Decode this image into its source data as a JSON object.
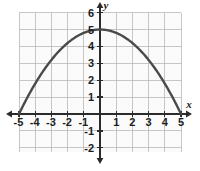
{
  "chart_data": {
    "type": "line",
    "title": "",
    "subtitle": "",
    "xlabel": "x",
    "ylabel": "y",
    "xlim": [
      -5.6,
      5.6
    ],
    "ylim": [
      -2.6,
      6.4
    ],
    "grid": true,
    "grid_step": 1,
    "legend": "none",
    "annotations": [],
    "curve": {
      "name": "parabola",
      "equation": "y = 5 - 0.2x^2",
      "vertex": [
        0,
        5
      ],
      "roots": [
        -5,
        5
      ],
      "domain": [
        -5,
        5
      ],
      "color": "#4a4a4a",
      "x": [
        -5,
        -4.5,
        -4,
        -3.5,
        -3,
        -2.5,
        -2,
        -1.5,
        -1,
        -0.5,
        0,
        0.5,
        1,
        1.5,
        2,
        2.5,
        3,
        3.5,
        4,
        4.5,
        5
      ],
      "y": [
        0,
        0.95,
        1.8,
        2.55,
        3.2,
        3.75,
        4.2,
        4.55,
        4.8,
        4.95,
        5,
        4.95,
        4.8,
        4.55,
        4.2,
        3.75,
        3.2,
        2.55,
        1.8,
        0.95,
        0
      ]
    },
    "x_ticks": [
      -5,
      -4,
      -3,
      -2,
      -1,
      1,
      2,
      3,
      4,
      5
    ],
    "x_tick_labels": [
      "-5",
      "-4",
      "-3",
      "-2",
      "-1",
      "1",
      "2",
      "3",
      "4",
      "5"
    ],
    "y_ticks": [
      6,
      5,
      4,
      3,
      2,
      1,
      -1,
      -2
    ],
    "y_tick_labels": [
      "6",
      "5",
      "4",
      "3",
      "2",
      "1",
      "-1",
      "-2"
    ],
    "colors": {
      "curve": "#4a4a4a",
      "axis": "#2b2b2b",
      "grid": "#b9b9b9",
      "text": "#1c1c1c",
      "background": "#ffffff",
      "plot_background": "#fbfbfb"
    }
  },
  "axes": {
    "x_name": "x",
    "y_name": "y"
  }
}
